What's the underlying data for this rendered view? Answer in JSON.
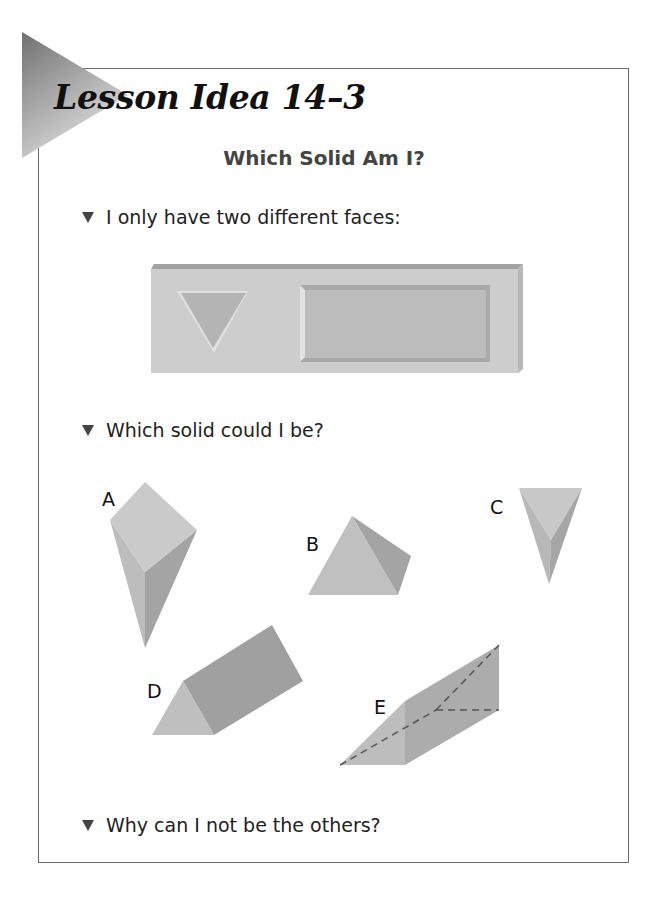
{
  "lesson": {
    "title": "Lesson Idea 14–3",
    "subtitle": "Which Solid Am I?"
  },
  "prompts": [
    {
      "text": "I only have two different faces:",
      "bullet_icon": "triangle-down-bullet"
    },
    {
      "text": "Which solid could I be?",
      "bullet_icon": "triangle-down-bullet"
    },
    {
      "text": "Why can I not be the others?",
      "bullet_icon": "triangle-down-bullet"
    }
  ],
  "faces_panel": {
    "faces": [
      "triangle",
      "rectangle"
    ]
  },
  "solids": [
    {
      "label": "A",
      "shape": "square-pyramid"
    },
    {
      "label": "B",
      "shape": "tetrahedron"
    },
    {
      "label": "C",
      "shape": "triangular-pyramid"
    },
    {
      "label": "D",
      "shape": "triangular-prism"
    },
    {
      "label": "E",
      "shape": "triangular-prism-wedge-with-hidden-edges"
    }
  ],
  "colors": {
    "frame": "#6a6a6a",
    "solid_light": "#c4c4c4",
    "solid_mid": "#b0b0b0",
    "solid_dark": "#9a9a9a",
    "text": "#222222",
    "subtitle": "#444444"
  }
}
